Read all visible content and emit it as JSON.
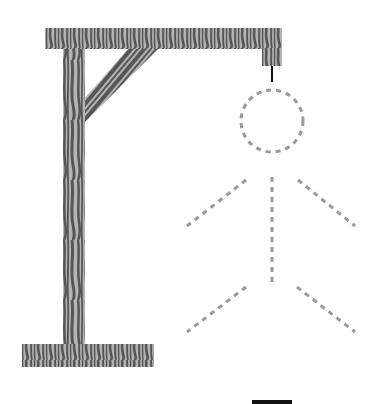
{
  "game": {
    "name": "Hangman",
    "gallows": {
      "wood_light": "#b4b4b4",
      "wood_dark": "#565656",
      "rope_color": "#111111"
    },
    "figure": {
      "stroke_color": "#9a9a9a",
      "style": "dashed",
      "parts": [
        "head",
        "body",
        "left-arm",
        "right-arm",
        "left-leg",
        "right-leg"
      ],
      "revealed_parts": 0
    },
    "word": {
      "blanks_visible": 1,
      "letters": [
        ""
      ]
    }
  }
}
